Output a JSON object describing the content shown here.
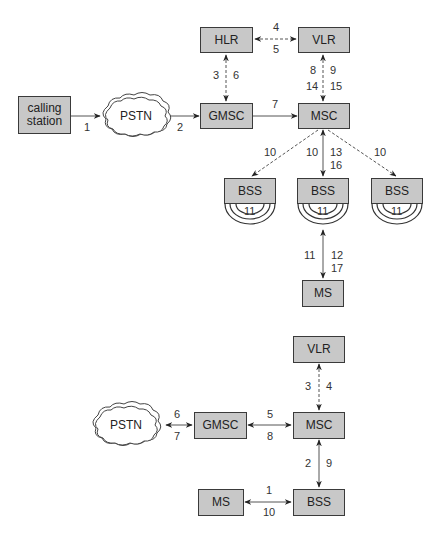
{
  "diagram_top": {
    "title": "Mobile-terminated call setup (via HLR)",
    "nodes": {
      "calling_station": "calling\nstation",
      "pstn": "PSTN",
      "gmsc": "GMSC",
      "msc": "MSC",
      "hlr": "HLR",
      "vlr": "VLR",
      "bss1": "BSS",
      "bss2": "BSS",
      "bss3": "BSS",
      "ms": "MS"
    },
    "labels": {
      "cs_pstn": "1",
      "pstn_gmsc": "2",
      "gmsc_hlr_a": "3",
      "gmsc_hlr_b": "6",
      "hlr_vlr_a": "4",
      "hlr_vlr_b": "5",
      "gmsc_msc": "7",
      "vlr_msc_a": "8",
      "vlr_msc_b": "9",
      "vlr_msc_c": "14",
      "vlr_msc_d": "15",
      "msc_bss1": "10",
      "msc_bss2": "10",
      "msc_bss2_b": "13",
      "msc_bss2_c": "16",
      "msc_bss3": "10",
      "bss1_radio": "11",
      "bss2_radio": "11",
      "bss3_radio": "11",
      "bss_ms_a": "11",
      "bss_ms_b": "12",
      "bss_ms_c": "17"
    }
  },
  "diagram_bottom": {
    "title": "Mobile-originated call setup",
    "nodes": {
      "vlr": "VLR",
      "pstn": "PSTN",
      "gmsc": "GMSC",
      "msc": "MSC",
      "ms": "MS",
      "bss": "BSS"
    },
    "labels": {
      "vlr_msc_a": "3",
      "vlr_msc_b": "4",
      "pstn_gmsc_a": "6",
      "pstn_gmsc_b": "7",
      "gmsc_msc_a": "5",
      "gmsc_msc_b": "8",
      "msc_bss_a": "2",
      "msc_bss_b": "9",
      "ms_bss_a": "1",
      "ms_bss_b": "10"
    }
  },
  "colors": {
    "box_fill": "#c8c8c8",
    "box_border": "#3a3a3a",
    "line": "#444444"
  }
}
